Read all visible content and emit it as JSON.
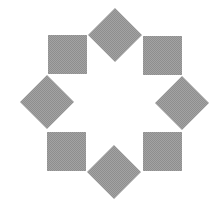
{
  "diagram": {
    "title": "",
    "background": "#ffffff",
    "fill_color": "#9a9a9a",
    "shapes": [
      {
        "type": "diamond",
        "name": "top-diamond",
        "cx": 115,
        "cy": 35,
        "r": 27
      },
      {
        "type": "square",
        "name": "top-right-square",
        "x": 143,
        "y": 36,
        "size": 39
      },
      {
        "type": "diamond",
        "name": "right-diamond",
        "cx": 182,
        "cy": 103,
        "r": 27
      },
      {
        "type": "square",
        "name": "bottom-right-square",
        "x": 143,
        "y": 132,
        "size": 39
      },
      {
        "type": "diamond",
        "name": "bottom-diamond",
        "cx": 114,
        "cy": 172,
        "r": 27
      },
      {
        "type": "square",
        "name": "bottom-left-square",
        "x": 47,
        "y": 132,
        "size": 39
      },
      {
        "type": "diamond",
        "name": "left-diamond",
        "cx": 47,
        "cy": 102,
        "r": 27
      },
      {
        "type": "square",
        "name": "top-left-square",
        "x": 48,
        "y": 35,
        "size": 39
      }
    ]
  }
}
